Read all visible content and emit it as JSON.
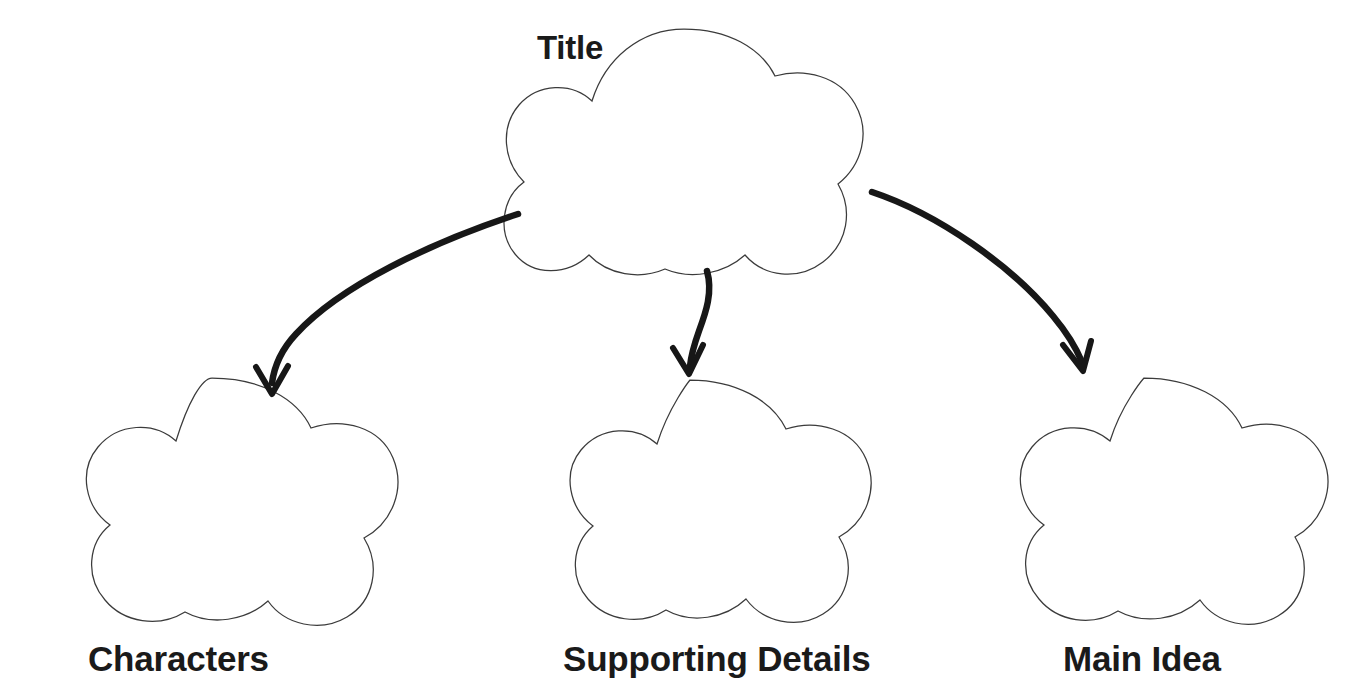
{
  "page": {
    "background_color": "#ffffff",
    "width": 1347,
    "height": 697,
    "diagram_type": "graphic-organizer",
    "shape_outline_color": "#3b3b3b",
    "arrow_color": "#171717",
    "label_color": "#1a1a1a"
  },
  "nodes": {
    "title": {
      "label": "Title",
      "label_x": 537,
      "label_y": 31,
      "shape_cx": 684,
      "shape_cy": 153,
      "shape_rx": 171,
      "shape_ry": 124
    },
    "children": [
      {
        "id": "characters",
        "label": "Characters",
        "label_x": 88,
        "label_y": 641,
        "shape_cx": 212,
        "shape_cy": 503,
        "shape_rx": 185,
        "shape_ry": 125
      },
      {
        "id": "supporting-details",
        "label": "Supporting Details",
        "label_x": 563,
        "label_y": 641,
        "shape_cx": 690,
        "shape_cy": 504,
        "shape_rx": 180,
        "shape_ry": 124
      },
      {
        "id": "main-idea",
        "label": "Main Idea",
        "label_x": 1063,
        "label_y": 641,
        "shape_cx": 1144,
        "shape_cy": 503,
        "shape_rx": 181,
        "shape_ry": 125
      }
    ]
  },
  "arrows": [
    {
      "id": "arrow-to-characters",
      "from": "title",
      "to": "characters",
      "path": "M 518 214 C 430 243 340 286 296 334 C 281 350 274 368 272 383",
      "head": "M 256 367 L 272 394 L 288 366"
    },
    {
      "id": "arrow-to-supporting-details",
      "from": "title",
      "to": "supporting-details",
      "path": "M 707 271 C 713 292 706 312 699 331 C 694 345 691 357 690 366",
      "head": "M 673 348 L 689 374 L 703 345"
    },
    {
      "id": "arrow-to-main-idea",
      "from": "title",
      "to": "main-idea",
      "path": "M 872 192 C 938 214 1012 266 1053 316 C 1068 334 1077 350 1082 362",
      "head": "M 1063 345 L 1083 371 L 1091 341"
    }
  ]
}
